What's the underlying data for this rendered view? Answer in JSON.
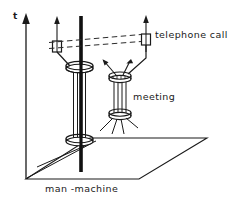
{
  "figure": {
    "type": "space-time-diagram",
    "axis": {
      "vertical_label": "t",
      "vertical_label_meaning": "time-axis",
      "arrow_direction": "up"
    },
    "labels": {
      "ground_plane": "man -machine",
      "upper_event": "telephone call",
      "middle_event": "meeting"
    },
    "colors": {
      "stroke": "#1a1a1a",
      "background": "#ffffff",
      "dashed_stroke": "#333333"
    },
    "elements": [
      {
        "name": "time-axis",
        "kind": "arrow",
        "label": "t"
      },
      {
        "name": "ground-plane",
        "kind": "parallelogram",
        "label": "man -machine"
      },
      {
        "name": "man-worldline",
        "kind": "thick-vertical-line"
      },
      {
        "name": "machine-tube-lower",
        "kind": "cylinder-with-discs"
      },
      {
        "name": "meeting-tube",
        "kind": "cylinder-with-discs",
        "label": "meeting"
      },
      {
        "name": "telephone-box-left",
        "kind": "small-box-with-arrow"
      },
      {
        "name": "telephone-box-right",
        "kind": "small-box-with-arrow",
        "label": "telephone call"
      },
      {
        "name": "telephone-link",
        "kind": "dashed-double-line"
      }
    ]
  }
}
